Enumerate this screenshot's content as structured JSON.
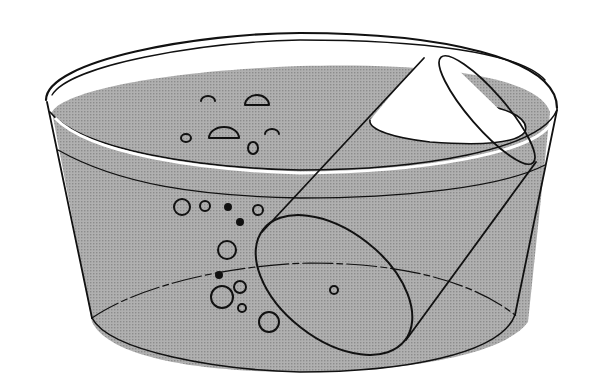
{
  "figure": {
    "colors": {
      "background": "#ffffff",
      "water": "#a9a9a9",
      "ink": "#111111",
      "air_in_cylinder": "#ffffff"
    },
    "bubbles_surface": [
      {
        "cx": 208,
        "cy": 99,
        "rx": 7,
        "ry": 4
      },
      {
        "cx": 257,
        "cy": 101,
        "rx": 12,
        "ry": 9
      },
      {
        "cx": 186,
        "cy": 138,
        "rx": 5,
        "ry": 4
      },
      {
        "cx": 224,
        "cy": 131,
        "rx": 15,
        "ry": 9
      },
      {
        "cx": 272,
        "cy": 131,
        "rx": 7,
        "ry": 4
      },
      {
        "cx": 253,
        "cy": 148,
        "rx": 5,
        "ry": 6
      }
    ],
    "bubbles_underwater": [
      {
        "cx": 182,
        "cy": 207,
        "r": 8
      },
      {
        "cx": 205,
        "cy": 206,
        "r": 5
      },
      {
        "cx": 228,
        "cy": 207,
        "r": 3,
        "filled": true
      },
      {
        "cx": 258,
        "cy": 210,
        "r": 5
      },
      {
        "cx": 240,
        "cy": 222,
        "r": 3,
        "filled": true
      },
      {
        "cx": 227,
        "cy": 250,
        "r": 9
      },
      {
        "cx": 219,
        "cy": 275,
        "r": 3,
        "filled": true
      },
      {
        "cx": 240,
        "cy": 287,
        "r": 6
      },
      {
        "cx": 222,
        "cy": 297,
        "r": 11
      },
      {
        "cx": 242,
        "cy": 308,
        "r": 4
      },
      {
        "cx": 269,
        "cy": 322,
        "r": 10
      },
      {
        "cx": 334,
        "cy": 290,
        "r": 4
      }
    ]
  }
}
